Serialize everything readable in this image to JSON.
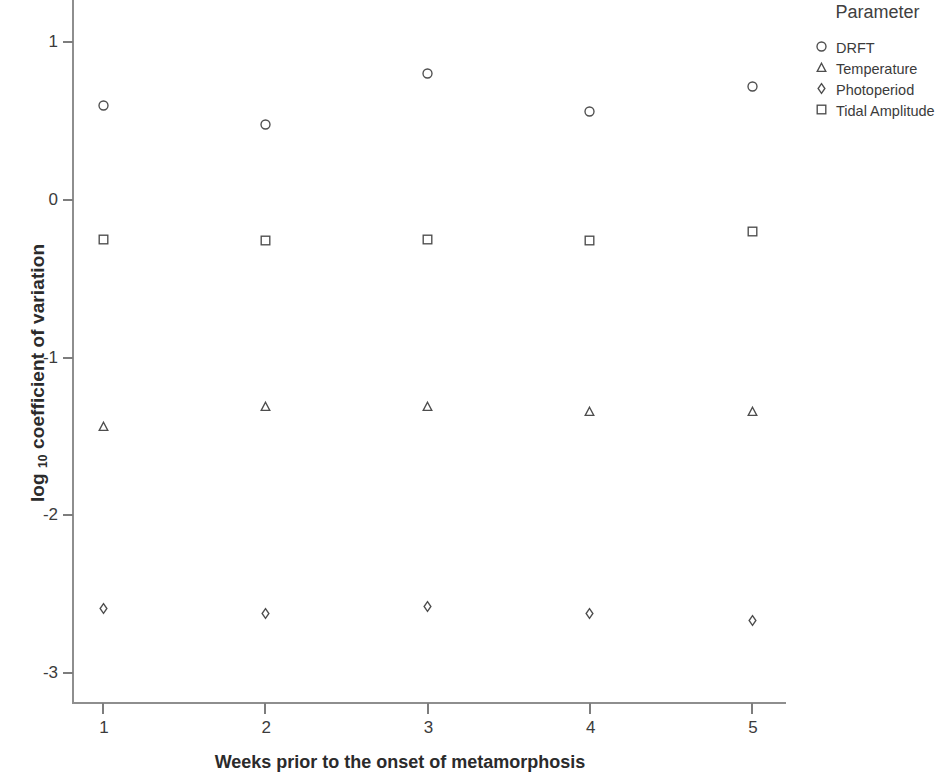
{
  "chart_data": {
    "type": "scatter",
    "title": "",
    "xlabel": "Weeks prior to the onset of metamorphosis",
    "ylabel": "log 10 coefficient of variation",
    "ylabel_main": "log ",
    "ylabel_sub": "10",
    "ylabel_rest": " coefficient of variation",
    "legend_title": "Parameter",
    "legend_position": "top-right",
    "grid": false,
    "x": [
      1,
      2,
      3,
      4,
      5
    ],
    "categories": [
      "1",
      "2",
      "3",
      "4",
      "5"
    ],
    "xlim": [
      0.5,
      5.5
    ],
    "ylim": [
      -3.2,
      1.2
    ],
    "xticks": [
      "1",
      "2",
      "3",
      "4",
      "5"
    ],
    "yticks": [
      "1",
      "0",
      "-1",
      "-2",
      "-3"
    ],
    "ytick_values": [
      1,
      0,
      -1,
      -2,
      -3
    ],
    "series": [
      {
        "name": "DRFT",
        "marker": "circle",
        "color": "#4d4d4d",
        "values": [
          0.6,
          0.48,
          0.8,
          0.56,
          0.72
        ]
      },
      {
        "name": "Temperature",
        "marker": "triangle",
        "color": "#4d4d4d",
        "values": [
          -1.44,
          -1.31,
          -1.31,
          -1.34,
          -1.34
        ]
      },
      {
        "name": "Photoperiod",
        "marker": "diamond",
        "color": "#4d4d4d",
        "values": [
          -2.59,
          -2.62,
          -2.58,
          -2.62,
          -2.67
        ]
      },
      {
        "name": "Tidal Amplitude",
        "marker": "square",
        "color": "#4d4d4d",
        "values": [
          -0.25,
          -0.26,
          -0.25,
          -0.26,
          -0.2
        ]
      }
    ]
  }
}
